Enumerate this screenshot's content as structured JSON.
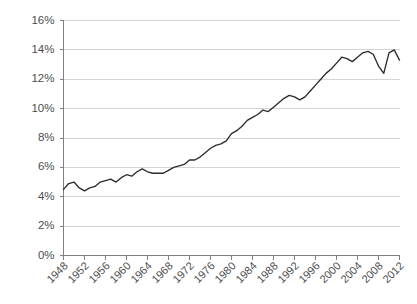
{
  "chart_data": {
    "type": "line",
    "title": "",
    "subtitle": "",
    "xlabel": "",
    "ylabel": "",
    "xlim": [
      1948,
      2012
    ],
    "ylim": [
      0,
      16
    ],
    "grid": true,
    "legend": false,
    "legend_position": "none",
    "y_tick_labels": [
      "0%",
      "2%",
      "4%",
      "6%",
      "8%",
      "10%",
      "12%",
      "14%",
      "16%"
    ],
    "y_tick_values": [
      0,
      2,
      4,
      6,
      8,
      10,
      12,
      14,
      16
    ],
    "x_tick_labels": [
      "1948",
      "1952",
      "1956",
      "1960",
      "1964",
      "1968",
      "1972",
      "1976",
      "1980",
      "1984",
      "1988",
      "1992",
      "1996",
      "2000",
      "2004",
      "2008",
      "2012"
    ],
    "x_tick_values": [
      1948,
      1952,
      1956,
      1960,
      1964,
      1968,
      1972,
      1976,
      1980,
      1984,
      1988,
      1992,
      1996,
      2000,
      2004,
      2008,
      2012
    ],
    "line_color": "#2b2b2b",
    "grid_color": "#d4d4d4",
    "axis_color": "#808080",
    "series": [
      {
        "name": "series-1",
        "x": [
          1948,
          1949,
          1950,
          1951,
          1952,
          1953,
          1954,
          1955,
          1956,
          1957,
          1958,
          1959,
          1960,
          1961,
          1962,
          1963,
          1964,
          1965,
          1966,
          1967,
          1968,
          1969,
          1970,
          1971,
          1972,
          1973,
          1974,
          1975,
          1976,
          1977,
          1978,
          1979,
          1980,
          1981,
          1982,
          1983,
          1984,
          1985,
          1986,
          1987,
          1988,
          1989,
          1990,
          1991,
          1992,
          1993,
          1994,
          1995,
          1996,
          1997,
          1998,
          1999,
          2000,
          2001,
          2002,
          2003,
          2004,
          2005,
          2006,
          2007,
          2008,
          2009,
          2010,
          2011,
          2012
        ],
        "values": [
          4.5,
          4.9,
          5.0,
          4.6,
          4.4,
          4.6,
          4.7,
          5.0,
          5.1,
          5.2,
          5.0,
          5.3,
          5.5,
          5.4,
          5.7,
          5.9,
          5.7,
          5.6,
          5.6,
          5.6,
          5.8,
          6.0,
          6.1,
          6.2,
          6.5,
          6.5,
          6.7,
          7.0,
          7.3,
          7.5,
          7.6,
          7.8,
          8.3,
          8.5,
          8.8,
          9.2,
          9.4,
          9.6,
          9.9,
          9.8,
          10.1,
          10.4,
          10.7,
          10.9,
          10.8,
          10.6,
          10.8,
          11.2,
          11.6,
          12.0,
          12.4,
          12.7,
          13.1,
          13.5,
          13.4,
          13.2,
          13.5,
          13.8,
          13.9,
          13.7,
          12.9,
          12.4,
          13.8,
          14.0,
          13.3
        ],
        "color": "#2b2b2b"
      }
    ]
  }
}
